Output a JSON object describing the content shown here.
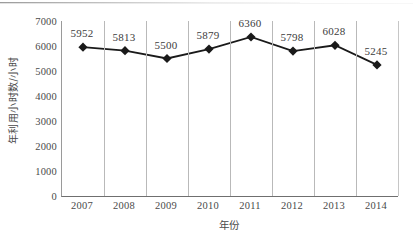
{
  "chart_data": {
    "type": "line",
    "title": "",
    "subtitle": "",
    "xlabel": "年份",
    "ylabel": "年利用小时数/小时",
    "categories": [
      "2007",
      "2008",
      "2009",
      "2010",
      "2011",
      "2012",
      "2013",
      "2014"
    ],
    "values": [
      5952,
      5813,
      5500,
      5879,
      6360,
      5798,
      6028,
      5245
    ],
    "data_labels": [
      "5952",
      "5813",
      "5500",
      "5879",
      "6360",
      "5798",
      "6028",
      "5245"
    ],
    "series": [
      {
        "name": "年利用小时数",
        "values": [
          5952,
          5813,
          5500,
          5879,
          6360,
          5798,
          6028,
          5245
        ]
      }
    ],
    "ylim": [
      0,
      7000
    ],
    "ytick_labels": [
      "0",
      "1000",
      "2000",
      "3000",
      "4000",
      "5000",
      "6000",
      "7000"
    ],
    "ytick_values": [
      0,
      1000,
      2000,
      3000,
      4000,
      5000,
      6000,
      7000
    ],
    "grid": "vertical-only",
    "legend": "none",
    "marker": "diamond",
    "line_color": "#1a1a1a",
    "marker_color": "#1a1a1a",
    "grid_color": "#b9b9b9",
    "axis_color": "#6f6f6f",
    "text_color": "#4a4a4a",
    "background": "#ffffff"
  }
}
